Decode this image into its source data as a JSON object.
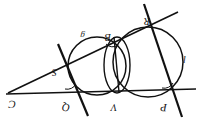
{
  "figure": {
    "background_color": "#ffffff",
    "stroke_color": "#111111",
    "canvas": {
      "width": 204,
      "height": 128
    }
  },
  "points": [
    {
      "id": "C",
      "label": "C",
      "x": 18,
      "y": 92,
      "label_x": 16,
      "label_y": 101
    },
    {
      "id": "S",
      "label": "S",
      "x": 65,
      "y": 68,
      "label_x": 57,
      "label_y": 68
    },
    {
      "id": "Q",
      "label": "Q",
      "x": 74,
      "y": 93,
      "label_x": 70,
      "label_y": 103
    },
    {
      "id": "B",
      "label": "B",
      "x": 114,
      "y": 37,
      "label_x": 110,
      "label_y": 34
    },
    {
      "id": "R",
      "label": "R",
      "x": 151,
      "y": 19,
      "label_x": 150,
      "label_y": 18
    },
    {
      "id": "V",
      "label": "V",
      "x": 119,
      "y": 92,
      "label_x": 117,
      "label_y": 103
    },
    {
      "id": "P",
      "label": "P",
      "x": 171,
      "y": 92,
      "label_x": 167,
      "label_y": 103
    }
  ],
  "circle_labels": [
    {
      "id": "left-circle-label",
      "label": "g",
      "x": 85,
      "y": 33
    },
    {
      "id": "right-circle-label",
      "label": "l",
      "x": 186,
      "y": 56
    }
  ],
  "circles": [
    {
      "id": "left-circle",
      "cx": 97,
      "cy": 66,
      "r": 29
    },
    {
      "id": "middle-circle",
      "cx": 117,
      "cy": 65,
      "r": 28,
      "rx": 13,
      "ry": 28
    },
    {
      "id": "right-circle",
      "cx": 148,
      "cy": 62,
      "r": 35
    }
  ],
  "lines": [
    {
      "id": "base-line",
      "from": "C",
      "to": "P",
      "x1": 6,
      "y1": 94,
      "x2": 196,
      "y2": 89
    },
    {
      "id": "secant-c-r",
      "from": "C",
      "to": "R",
      "x1": 8,
      "y1": 93,
      "x2": 178,
      "y2": 12
    },
    {
      "id": "line-s-q",
      "from": "S",
      "to": "Q",
      "x1": 58,
      "y1": 44,
      "x2": 88,
      "y2": 116
    },
    {
      "id": "line-r-p",
      "from": "R",
      "to": "P",
      "x1": 144,
      "y1": 4,
      "x2": 182,
      "y2": 117
    },
    {
      "id": "chord-b-v",
      "from": "B",
      "to": "V",
      "x1": 114,
      "y1": 37,
      "x2": 119,
      "y2": 92
    }
  ],
  "angle_marks": [
    {
      "id": "angle-at-b",
      "cx": 114,
      "cy": 37,
      "r": 8
    },
    {
      "id": "angle-at-q",
      "cx": 74,
      "cy": 93,
      "r": 9
    },
    {
      "id": "angle-at-p",
      "cx": 171,
      "cy": 92,
      "r": 9
    }
  ]
}
